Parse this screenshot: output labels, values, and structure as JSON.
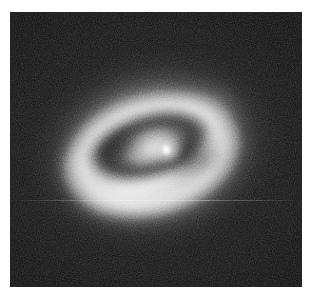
{
  "document": {
    "background_color": "#ffffff",
    "width": 312,
    "height": 300
  },
  "figure": {
    "name": "astronomical-grayscale-image",
    "colormap": "grayscale",
    "panel": {
      "left": 10,
      "top": 12,
      "width": 292,
      "height": 275,
      "background_color": "#050505"
    },
    "features": [
      {
        "id": "sky-background",
        "label": "noisy dark sky background",
        "color": "#0a0a0a"
      },
      {
        "id": "outer-halo",
        "label": "diffuse elliptical stellar halo",
        "center_x": 152,
        "center_y": 150,
        "major_axis": 268,
        "minor_axis": 206,
        "position_angle_deg": -14,
        "color": "#b0b0b0"
      },
      {
        "id": "bright-ring",
        "label": "bright star-forming ring",
        "center_x": 150,
        "center_y": 155,
        "major_axis": 186,
        "minor_axis": 124,
        "position_angle_deg": -15,
        "color": "#e0e0e0"
      },
      {
        "id": "dust-lane",
        "label": "dark inner dust lane ring",
        "center_x": 148,
        "center_y": 146,
        "major_axis": 126,
        "minor_axis": 66,
        "position_angle_deg": -17,
        "color": "#000000"
      },
      {
        "id": "nucleus",
        "label": "bright compact nucleus",
        "center_x": 156,
        "center_y": 138,
        "peak_color": "#ffffff"
      },
      {
        "id": "scanline-artifact",
        "label": "horizontal detector scanline artifact",
        "row_y": 200,
        "color": "#ffffff"
      }
    ]
  }
}
